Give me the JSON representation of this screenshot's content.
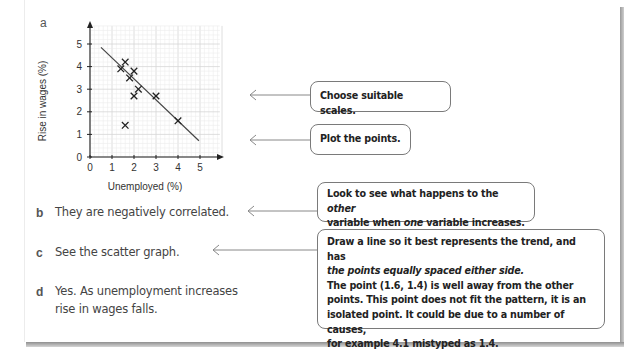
{
  "parts": {
    "a": {
      "label": "a"
    },
    "b": {
      "label": "b",
      "answer": "They are negatively correlated."
    },
    "c": {
      "label": "c",
      "answer": "See the scatter graph."
    },
    "d": {
      "label": "d",
      "answer_line1": "Yes. As unemployment increases",
      "answer_line2": "rise in wages falls."
    }
  },
  "callouts": {
    "scales": "Choose suitable scales.",
    "plot": "Plot the points.",
    "correlation": {
      "line1_a": "Look to see what happens to the ",
      "line1_em": "other",
      "line2_a": "variable when ",
      "line2_em": "one",
      "line2_b": " variable increases."
    },
    "trend": {
      "line1": "Draw a line so it best represents the trend, and has",
      "line2": "the points equally spaced either side.",
      "line3": "The point (1.6, 1.4) is well away from the other",
      "line4": "points. This point does not fit the pattern, it is an",
      "line5": "isolated point. It could be due to a number of causes,",
      "line6": "for example 4.1 mistyped as 1.4."
    }
  },
  "chart_data": {
    "type": "scatter",
    "title": "",
    "xlabel": "Unemployed (%)",
    "ylabel": "Rise in wages (%)",
    "xlim": [
      0,
      5.9
    ],
    "ylim": [
      0,
      5.8
    ],
    "x_ticks": [
      "0",
      "1",
      "2",
      "3",
      "4",
      "5"
    ],
    "y_ticks": [
      "0",
      "1",
      "2",
      "3",
      "4",
      "5"
    ],
    "grid": true,
    "marker": "x",
    "points": [
      {
        "x": 1.4,
        "y": 3.9
      },
      {
        "x": 1.6,
        "y": 4.2
      },
      {
        "x": 2.0,
        "y": 3.8
      },
      {
        "x": 1.8,
        "y": 3.5
      },
      {
        "x": 2.2,
        "y": 3.0
      },
      {
        "x": 2.0,
        "y": 2.7
      },
      {
        "x": 3.0,
        "y": 2.7
      },
      {
        "x": 4.0,
        "y": 1.6
      },
      {
        "x": 1.6,
        "y": 1.4
      }
    ],
    "line_of_best_fit": {
      "x1": 0.5,
      "y1": 4.85,
      "x2": 4.95,
      "y2": 0.72
    },
    "outlier": {
      "x": 1.6,
      "y": 1.4
    }
  }
}
